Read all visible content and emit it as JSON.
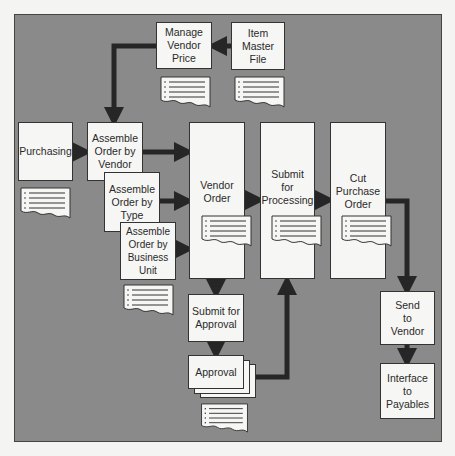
{
  "diagram": {
    "type": "process-flow",
    "nodes": {
      "manage_vendor_price": "Manage\nVendor\nPrice",
      "item_master_file": "Item\nMaster\nFile",
      "purchasing": "Purchasing",
      "assemble_by_vendor": "Assemble\nOrder by\nVendor",
      "assemble_by_type": "Assemble\nOrder by\nType",
      "assemble_by_business_unit": "Assemble\nOrder by\nBusiness Unit",
      "vendor_order": "Vendor\nOrder",
      "submit_for_processing": "Submit\nfor\nProcessing",
      "cut_purchase_order": "Cut\nPurchase\nOrder",
      "submit_for_approval": "Submit for\nApproval",
      "approval": "Approval",
      "send_to_vendor": "Send\nto\nVendor",
      "interface_to_payables": "Interface\nto\nPayables"
    },
    "edges": [
      [
        "item_master_file",
        "manage_vendor_price"
      ],
      [
        "manage_vendor_price",
        "assemble_by_vendor"
      ],
      [
        "purchasing",
        "assemble_by_vendor"
      ],
      [
        "assemble_by_vendor",
        "vendor_order"
      ],
      [
        "assemble_by_type",
        "vendor_order"
      ],
      [
        "assemble_by_business_unit",
        "vendor_order"
      ],
      [
        "vendor_order",
        "submit_for_processing"
      ],
      [
        "submit_for_processing",
        "cut_purchase_order"
      ],
      [
        "vendor_order",
        "submit_for_approval"
      ],
      [
        "submit_for_approval",
        "approval"
      ],
      [
        "approval",
        "submit_for_processing"
      ],
      [
        "cut_purchase_order",
        "send_to_vendor"
      ],
      [
        "send_to_vendor",
        "interface_to_payables"
      ]
    ],
    "colors": {
      "panel": "#8a8a8a",
      "box": "#f6f6f4",
      "arrow": "#262626"
    }
  }
}
